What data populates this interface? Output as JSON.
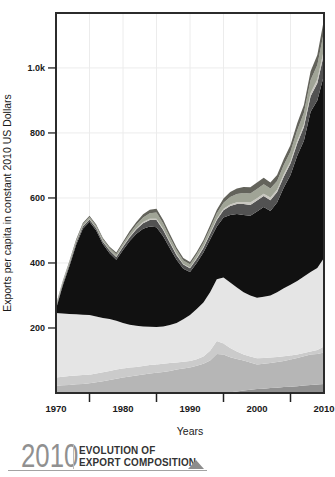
{
  "page": {
    "background": "#ffffff"
  },
  "y_axis": {
    "title": "Exports per capita in constant 2010 US Dollars",
    "tick_labels": [
      "1.0k",
      "800",
      "600",
      "400",
      "200"
    ],
    "tick_values": [
      1000,
      800,
      600,
      400,
      200
    ]
  },
  "x_axis": {
    "title": "Years",
    "tick_labels": [
      "1970",
      "1980",
      "1990",
      "2000",
      "2010"
    ],
    "tick_values": [
      1970,
      1980,
      1990,
      2000,
      2010
    ],
    "minor_tick_values": [
      1975,
      1985,
      1995,
      2005
    ]
  },
  "footer": {
    "year": "2010",
    "title_line1": "EVOLUTION OF",
    "title_line2": "EXPORT COMPOSITION",
    "year_color": "#909090",
    "triangle_color": "#8c8c8c"
  },
  "chart_data": {
    "type": "area",
    "stacked": true,
    "title": "Evolution of export composition",
    "xlabel": "Years",
    "ylabel": "Exports per capita in constant 2010 US Dollars",
    "xlim": [
      1970,
      2010
    ],
    "ylim": [
      0,
      1169
    ],
    "grid": {
      "color": "#ececec",
      "x_step_years": 5,
      "y_step_value": 200
    },
    "border_color": "#2b2b2b",
    "x": [
      1970,
      1971,
      1972,
      1973,
      1974,
      1975,
      1976,
      1977,
      1978,
      1979,
      1980,
      1981,
      1982,
      1983,
      1984,
      1985,
      1986,
      1987,
      1988,
      1989,
      1990,
      1991,
      1992,
      1993,
      1994,
      1995,
      1996,
      1997,
      1998,
      1999,
      2000,
      2001,
      2002,
      2003,
      2004,
      2005,
      2006,
      2007,
      2008,
      2009,
      2010
    ],
    "series_note": "values are cumulative stack tops (exports per capita, constant 2010 USD); layers bottom to top",
    "series": [
      {
        "name": "bottom-dark-gray-strip",
        "color": "#909090",
        "top": [
          0,
          0,
          0,
          0,
          0,
          0,
          0,
          0,
          0,
          0,
          0,
          0,
          0,
          0,
          0,
          0,
          0,
          0,
          0,
          0,
          0,
          0,
          0,
          0,
          0,
          0,
          2,
          5,
          8,
          10,
          12,
          13,
          15,
          16,
          18,
          19,
          21,
          23,
          25,
          26,
          28
        ]
      },
      {
        "name": "lower-mid-gray",
        "color": "#b6b6b6",
        "top": [
          22,
          24,
          25,
          27,
          28,
          30,
          33,
          36,
          40,
          44,
          48,
          51,
          54,
          57,
          60,
          62,
          65,
          68,
          72,
          75,
          78,
          84,
          90,
          100,
          120,
          118,
          110,
          105,
          100,
          94,
          88,
          90,
          92,
          95,
          98,
          103,
          108,
          113,
          118,
          120,
          125
        ]
      },
      {
        "name": "lower-light-gray",
        "color": "#cbcbcb",
        "top": [
          48,
          50,
          52,
          54,
          55,
          56,
          60,
          64,
          68,
          72,
          75,
          78,
          80,
          83,
          86,
          88,
          90,
          92,
          94,
          96,
          98,
          104,
          112,
          130,
          160,
          152,
          138,
          128,
          118,
          112,
          107,
          108,
          109,
          111,
          113,
          115,
          118,
          123,
          128,
          132,
          143
        ]
      },
      {
        "name": "pale-gray-main",
        "color": "#e5e5e5",
        "top": [
          246,
          245,
          243,
          242,
          241,
          240,
          235,
          231,
          228,
          222,
          215,
          210,
          207,
          205,
          204,
          203,
          205,
          209,
          215,
          227,
          240,
          258,
          278,
          310,
          350,
          355,
          340,
          325,
          310,
          300,
          293,
          296,
          300,
          310,
          322,
          333,
          345,
          358,
          372,
          385,
          415
        ]
      },
      {
        "name": "black-main",
        "color": "#111111",
        "top": [
          258,
          330,
          390,
          455,
          505,
          527,
          500,
          458,
          430,
          410,
          440,
          468,
          490,
          505,
          512,
          510,
          482,
          445,
          410,
          382,
          372,
          400,
          432,
          472,
          512,
          540,
          548,
          551,
          548,
          545,
          558,
          572,
          560,
          586,
          632,
          671,
          730,
          776,
          865,
          900,
          978
        ]
      },
      {
        "name": "cap-dark-gray",
        "color": "#525252",
        "top": [
          263,
          336,
          396,
          462,
          512,
          534,
          507,
          465,
          438,
          418,
          450,
          479,
          504,
          522,
          532,
          532,
          501,
          462,
          424,
          395,
          384,
          413,
          446,
          489,
          532,
          562,
          575,
          581,
          581,
          578,
          592,
          606,
          593,
          618,
          665,
          706,
          768,
          818,
          913,
          953,
          1043
        ]
      },
      {
        "name": "cap-pale-line",
        "color": "#c9c7c0",
        "top": [
          264,
          337,
          397,
          463,
          513,
          535,
          508,
          467,
          439,
          420,
          452,
          482,
          507,
          526,
          536,
          536,
          505,
          465,
          428,
          397,
          386,
          416,
          450,
          492,
          536,
          567,
          580,
          587,
          588,
          586,
          599,
          613,
          601,
          625,
          673,
          713,
          776,
          827,
          923,
          964,
          1057
        ]
      },
      {
        "name": "cap-sage-gray",
        "color": "#a0a496",
        "top": [
          269,
          342,
          403,
          468,
          519,
          541,
          514,
          473,
          446,
          427,
          460,
          491,
          518,
          540,
          553,
          555,
          521,
          479,
          440,
          408,
          396,
          427,
          462,
          506,
          553,
          585,
          603,
          612,
          615,
          614,
          628,
          642,
          629,
          652,
          701,
          743,
          808,
          862,
          963,
          1009,
          1112
        ]
      },
      {
        "name": "cap-top-olive-gray",
        "color": "#63635b",
        "top": [
          272,
          345,
          406,
          472,
          523,
          545,
          518,
          477,
          450,
          432,
          465,
          498,
          526,
          550,
          564,
          567,
          532,
          489,
          448,
          415,
          403,
          434,
          470,
          516,
          564,
          598,
          618,
          629,
          634,
          633,
          648,
          662,
          648,
          671,
          720,
          763,
          830,
          886,
          990,
          1040,
          1150
        ]
      }
    ]
  }
}
